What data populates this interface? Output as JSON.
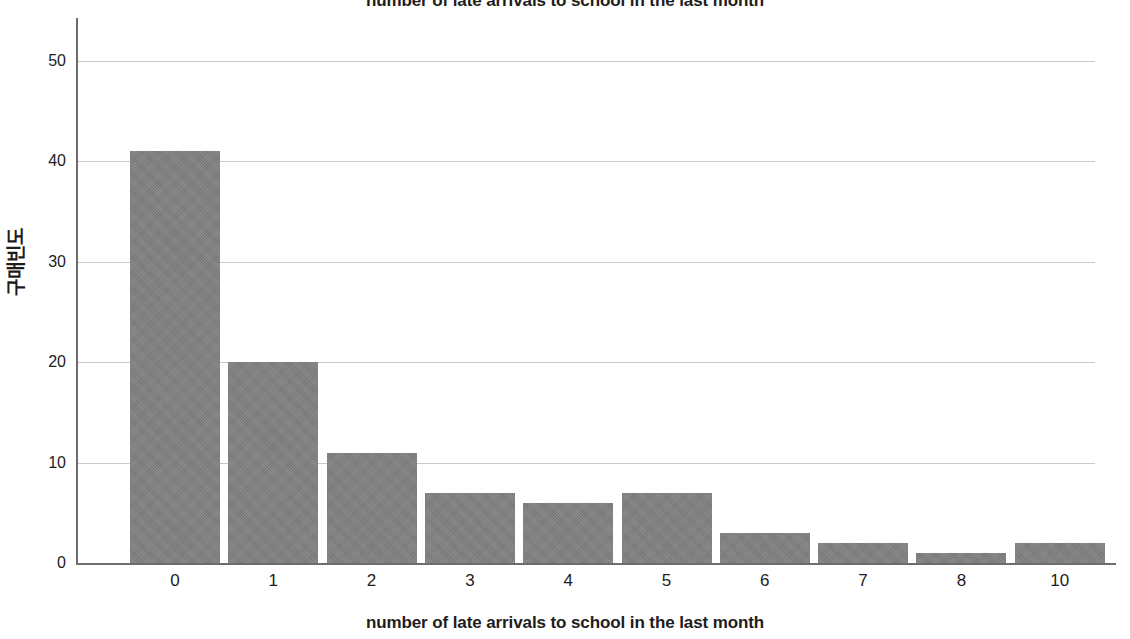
{
  "chart_data": {
    "type": "bar",
    "title": "number of late arrivals to school in the last month",
    "xlabel": "number of late arrivals to school in the last month",
    "ylabel": "구매빈도",
    "categories": [
      "0",
      "1",
      "2",
      "3",
      "4",
      "5",
      "6",
      "7",
      "8",
      "10"
    ],
    "values": [
      41,
      20,
      11,
      7,
      6,
      7,
      3,
      2,
      1,
      2
    ],
    "ylim": [
      0,
      52
    ],
    "y_ticks": [
      "0",
      "10",
      "20",
      "30",
      "40",
      "50"
    ],
    "y_tick_values": [
      0,
      10,
      20,
      30,
      40,
      50
    ],
    "grid": "horizontal",
    "legend": "none",
    "bar_color": "#808080",
    "axis_color": "#6d6d6d",
    "gridline_color": "#c9c9c9",
    "text_color": "#1d1d1d"
  }
}
